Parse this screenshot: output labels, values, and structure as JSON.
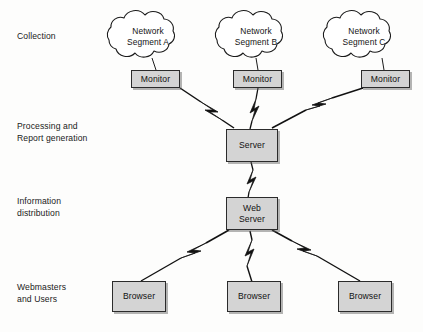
{
  "diagram": {
    "background_color": "#fdfdfc",
    "box_fill_color": "#d4d4d4",
    "box_stroke_color": "#2b2b2b",
    "connector_color": "#111111",
    "tiers": [
      {
        "id": "collection",
        "label": "Collection"
      },
      {
        "id": "processing",
        "label": "Processing and\nReport generation"
      },
      {
        "id": "distribution",
        "label": "Information\ndistribution"
      },
      {
        "id": "consumers",
        "label": "Webmasters\nand Users"
      }
    ],
    "clouds": [
      {
        "id": "segment-a",
        "label": "Network\nSegment A"
      },
      {
        "id": "segment-b",
        "label": "Network\nSegment B"
      },
      {
        "id": "segment-c",
        "label": "Network\nSegment C"
      }
    ],
    "monitors": [
      {
        "id": "monitor-a",
        "label": "Monitor"
      },
      {
        "id": "monitor-b",
        "label": "Monitor"
      },
      {
        "id": "monitor-c",
        "label": "Monitor"
      }
    ],
    "server": {
      "id": "server",
      "label": "Server"
    },
    "web_server": {
      "id": "web-server",
      "label": "Web\nServer"
    },
    "browsers": [
      {
        "id": "browser-1",
        "label": "Browser"
      },
      {
        "id": "browser-2",
        "label": "Browser"
      },
      {
        "id": "browser-3",
        "label": "Browser"
      }
    ],
    "connector_style": "lightning-bolt"
  }
}
